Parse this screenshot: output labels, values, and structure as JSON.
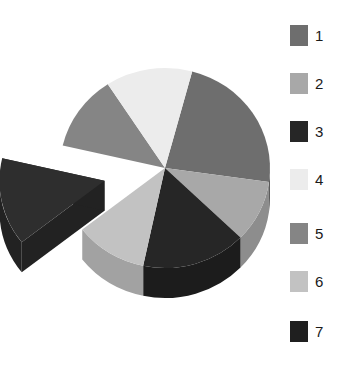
{
  "chart_data": {
    "type": "pie",
    "title": "",
    "subtitle": "",
    "xlabel": "",
    "ylabel": "",
    "three_d": true,
    "depth_px": 30,
    "grid": false,
    "legend_position": "right",
    "start_angle_deg": -75,
    "direction": "clockwise",
    "center": {
      "x": 165,
      "y": 168
    },
    "radius_x": 105,
    "radius_y": 100,
    "categories": [
      "1",
      "2",
      "3",
      "4",
      "5",
      "6",
      "7"
    ],
    "values": [
      23,
      10,
      16,
      14,
      12,
      11,
      14
    ],
    "colors": {
      "1": "#6e6e6e",
      "2": "#a8a8a8",
      "3": "#262626",
      "4": "#ececec",
      "5": "#858585",
      "6": "#c2c2c2",
      "7": "#2e2e2e"
    },
    "slices": [
      {
        "label": "1",
        "value": 23,
        "color": "#6e6e6e",
        "start_deg": -75,
        "end_deg": 8,
        "exploded": false,
        "wall_color": "#5a5a5a"
      },
      {
        "label": "2",
        "value": 10,
        "color": "#a8a8a8",
        "start_deg": 8,
        "end_deg": 44,
        "exploded": false,
        "wall_color": "#8d8d8d"
      },
      {
        "label": "3",
        "value": 16,
        "color": "#262626",
        "start_deg": 44,
        "end_deg": 102,
        "exploded": false,
        "wall_color": "#1c1c1c"
      },
      {
        "label": "6",
        "value": 11,
        "color": "#c2c2c2",
        "start_deg": 102,
        "end_deg": 142,
        "exploded": false,
        "wall_color": "#a2a2a2"
      },
      {
        "label": "7",
        "value": 14,
        "color": "#2e2e2e",
        "start_deg": 142,
        "end_deg": 193,
        "exploded": true,
        "explode_offset": 62,
        "wall_color": "#222222"
      },
      {
        "label": "5",
        "value": 12,
        "color": "#858585",
        "start_deg": 193,
        "end_deg": 237,
        "exploded": false,
        "wall_color": "#6f6f6f"
      },
      {
        "label": "4",
        "value": 14,
        "color": "#ececec",
        "start_deg": 237,
        "end_deg": 285,
        "exploded": false,
        "wall_color": "#c9c9c9"
      }
    ],
    "annotations": []
  },
  "legend": {
    "items": [
      {
        "label": "1",
        "color": "#6e6e6e",
        "y": 24
      },
      {
        "label": "2",
        "color": "#a8a8a8",
        "y": 72
      },
      {
        "label": "3",
        "color": "#262626",
        "y": 120
      },
      {
        "label": "4",
        "color": "#ececec",
        "y": 168
      },
      {
        "label": "5",
        "color": "#858585",
        "y": 222
      },
      {
        "label": "6",
        "color": "#c2c2c2",
        "y": 270
      },
      {
        "label": "7",
        "color": "#1f1f1f",
        "y": 320
      }
    ]
  },
  "background_color": "#ffffff"
}
